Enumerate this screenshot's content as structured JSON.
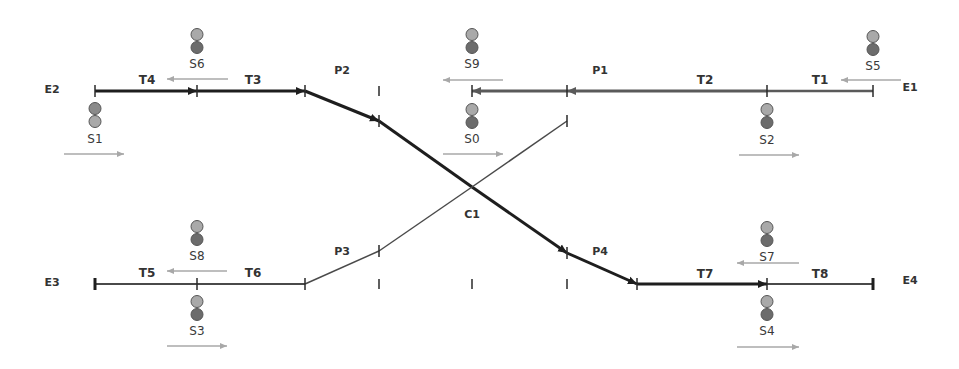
{
  "diagram": {
    "colors": {
      "route_active": "#1e1e1e",
      "route_reserved": "#5a5a5a",
      "track_idle": "#4a4a4a",
      "direction_arrow": "#a8a8a8",
      "lamp_light": "#a9a9a9",
      "lamp_dark": "#6c6c6c"
    },
    "endpoints": [
      {
        "id": "E1",
        "label": "E1",
        "x": 910,
        "y": 87
      },
      {
        "id": "E2",
        "label": "E2",
        "x": 52,
        "y": 89
      },
      {
        "id": "E3",
        "label": "E3",
        "x": 52,
        "y": 282
      },
      {
        "id": "E4",
        "label": "E4",
        "x": 910,
        "y": 280
      }
    ],
    "track_sections": [
      {
        "id": "T1",
        "label": "T1",
        "x": 820,
        "y": 80,
        "state": "reserved"
      },
      {
        "id": "T2",
        "label": "T2",
        "x": 705,
        "y": 80,
        "state": "reserved"
      },
      {
        "id": "T3",
        "label": "T3",
        "x": 253,
        "y": 80,
        "state": "active"
      },
      {
        "id": "T4",
        "label": "T4",
        "x": 147,
        "y": 80,
        "state": "active"
      },
      {
        "id": "T5",
        "label": "T5",
        "x": 147,
        "y": 273,
        "state": "idle"
      },
      {
        "id": "T6",
        "label": "T6",
        "x": 253,
        "y": 273,
        "state": "idle"
      },
      {
        "id": "T7",
        "label": "T7",
        "x": 705,
        "y": 274,
        "state": "active"
      },
      {
        "id": "T8",
        "label": "T8",
        "x": 820,
        "y": 274,
        "state": "idle"
      }
    ],
    "points": [
      {
        "id": "P1",
        "label": "P1",
        "x": 600,
        "y": 70
      },
      {
        "id": "P2",
        "label": "P2",
        "x": 342,
        "y": 70
      },
      {
        "id": "P3",
        "label": "P3",
        "x": 342,
        "y": 251
      },
      {
        "id": "P4",
        "label": "P4",
        "x": 600,
        "y": 251
      }
    ],
    "crossing": {
      "id": "C1",
      "label": "C1",
      "x": 472,
      "y": 214
    },
    "signals": [
      {
        "id": "S0",
        "label": "S0",
        "x": 472,
        "y": 103,
        "label_y": 139,
        "arrow": "right",
        "ax1": 443,
        "ax2": 503,
        "ay": 154
      },
      {
        "id": "S1",
        "label": "S1",
        "x": 95,
        "y": 102,
        "label_y": 139,
        "arrow": "right",
        "ax1": 64,
        "ax2": 124,
        "ay": 154
      },
      {
        "id": "S2",
        "label": "S2",
        "x": 767,
        "y": 103,
        "label_y": 140,
        "arrow": "right",
        "ax1": 739,
        "ax2": 799,
        "ay": 155
      },
      {
        "id": "S3",
        "label": "S3",
        "x": 197,
        "y": 295,
        "label_y": 331,
        "arrow": "right",
        "ax1": 167,
        "ax2": 227,
        "ay": 346
      },
      {
        "id": "S4",
        "label": "S4",
        "x": 767,
        "y": 295,
        "label_y": 331,
        "arrow": "right",
        "ax1": 737,
        "ax2": 799,
        "ay": 347
      },
      {
        "id": "S5",
        "label": "S5",
        "x": 873,
        "y": 30,
        "label_y": 66,
        "arrow": "left",
        "ax1": 841,
        "ax2": 901,
        "ay": 80
      },
      {
        "id": "S6",
        "label": "S6",
        "x": 197,
        "y": 28,
        "label_y": 64,
        "arrow": "left",
        "ax1": 167,
        "ax2": 228,
        "ay": 79
      },
      {
        "id": "S7",
        "label": "S7",
        "x": 767,
        "y": 221,
        "label_y": 257,
        "arrow": "left",
        "ax1": 737,
        "ax2": 799,
        "ay": 272
      },
      {
        "id": "S8",
        "label": "S8",
        "x": 197,
        "y": 220,
        "label_y": 256,
        "arrow": "left",
        "ax1": 167,
        "ax2": 227,
        "ay": 271
      },
      {
        "id": "S9",
        "label": "S9",
        "x": 472,
        "y": 28,
        "label_y": 64,
        "arrow": "left",
        "ax1": 443,
        "ax2": 503,
        "ay": 80
      }
    ]
  }
}
